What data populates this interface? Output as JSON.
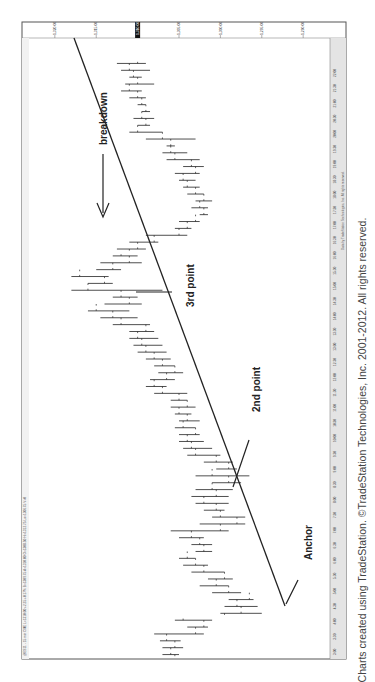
{
  "chart_data": {
    "type": "ohlc",
    "orientation": "rotated-90-ccw",
    "title": "",
    "header_text": "@ES11 - 15 min  CME  L=1310.00  +2.25  +0.17%  B=1309.75  A=1310.00  O=1308.50  Hi=1312.75  Lo=1306.75  V=0",
    "price_axis": {
      "side": "right",
      "ticks": [
        "1,320.00",
        "1,315.00",
        "1,310.00",
        "1,305.00",
        "1,300.00",
        "1,295.00",
        "1,290.00"
      ],
      "tick_values": [
        1320,
        1315,
        1310,
        1305,
        1300,
        1295,
        1290
      ],
      "last_price_label": "1,310.00",
      "ylim": [
        1287,
        1323
      ]
    },
    "time_axis": {
      "ticks": [
        "3:00",
        "3:30",
        "4:00",
        "4:30",
        "5:00",
        "5:30",
        "6:00",
        "6:30",
        "7:00",
        "7:30",
        "8:00",
        "8:30",
        "9:00",
        "9:30",
        "10:00",
        "10:30",
        "11:00",
        "11:30",
        "12:00",
        "12:30",
        "13:00",
        "13:30",
        "14:00",
        "14:30",
        "15:00",
        "15:30",
        "16:00",
        "16:30",
        "17:00",
        "17:30",
        "18:00",
        "18:30",
        "19:00",
        "19:30",
        "20:00",
        "20:30",
        "21:00",
        "21:30",
        "22:00"
      ]
    },
    "bars": [
      {
        "low": 1305.0,
        "high": 1307.0,
        "open": 1305.5,
        "close": 1306.0
      },
      {
        "low": 1304.5,
        "high": 1307.0,
        "open": 1306.0,
        "close": 1305.5
      },
      {
        "low": 1304.8,
        "high": 1307.3,
        "open": 1305.5,
        "close": 1306.5
      },
      {
        "low": 1302.0,
        "high": 1308.0,
        "open": 1306.5,
        "close": 1303.0
      },
      {
        "low": 1301.5,
        "high": 1304.0,
        "open": 1303.0,
        "close": 1302.0
      },
      {
        "low": 1301.0,
        "high": 1305.5,
        "open": 1302.0,
        "close": 1304.5
      },
      {
        "low": 1295.0,
        "high": 1300.0,
        "open": 1299.5,
        "close": 1297.5
      },
      {
        "low": 1295.5,
        "high": 1299.5,
        "open": 1297.5,
        "close": 1298.0
      },
      {
        "low": 1296.0,
        "high": 1299.0,
        "open": 1298.0,
        "close": 1296.5
      },
      {
        "low": 1297.5,
        "high": 1301.0,
        "open": 1296.5,
        "close": 1299.0
      },
      {
        "low": 1299.0,
        "high": 1302.5,
        "open": 1299.0,
        "close": 1300.5
      },
      {
        "low": 1298.5,
        "high": 1301.5,
        "open": 1300.5,
        "close": 1299.5
      },
      {
        "low": 1299.5,
        "high": 1303.5,
        "open": 1299.5,
        "close": 1302.0
      },
      {
        "low": 1301.5,
        "high": 1304.5,
        "open": 1302.0,
        "close": 1303.0
      },
      {
        "low": 1303.0,
        "high": 1305.0,
        "open": 1303.0,
        "close": 1304.0
      },
      {
        "low": 1301.0,
        "high": 1303.0,
        "open": 1304.0,
        "close": 1302.0
      },
      {
        "low": 1301.0,
        "high": 1303.5,
        "open": 1302.0,
        "close": 1302.5
      },
      {
        "low": 1302.0,
        "high": 1305.0,
        "open": 1302.5,
        "close": 1303.5
      },
      {
        "low": 1299.0,
        "high": 1306.0,
        "open": 1303.5,
        "close": 1300.0
      },
      {
        "low": 1297.0,
        "high": 1302.5,
        "open": 1300.0,
        "close": 1298.0
      },
      {
        "low": 1297.0,
        "high": 1301.0,
        "open": 1298.0,
        "close": 1300.0
      },
      {
        "low": 1299.5,
        "high": 1302.0,
        "open": 1300.0,
        "close": 1300.5
      },
      {
        "low": 1299.0,
        "high": 1303.0,
        "open": 1300.5,
        "close": 1302.0
      },
      {
        "low": 1299.0,
        "high": 1303.5,
        "open": 1302.0,
        "close": 1300.5
      },
      {
        "low": 1298.5,
        "high": 1303.0,
        "open": 1300.5,
        "close": 1301.0
      },
      {
        "low": 1297.5,
        "high": 1301.0,
        "open": 1301.0,
        "close": 1299.0
      },
      {
        "low": 1296.5,
        "high": 1303.0,
        "open": 1299.0,
        "close": 1301.0
      },
      {
        "low": 1298.0,
        "high": 1300.5,
        "open": 1301.0,
        "close": 1299.0
      },
      {
        "low": 1298.5,
        "high": 1302.0,
        "open": 1299.0,
        "close": 1300.5
      },
      {
        "low": 1300.0,
        "high": 1304.0,
        "open": 1300.5,
        "close": 1303.0
      },
      {
        "low": 1301.0,
        "high": 1304.5,
        "open": 1303.0,
        "close": 1303.5
      },
      {
        "low": 1302.0,
        "high": 1305.0,
        "open": 1303.5,
        "close": 1304.0
      },
      {
        "low": 1302.5,
        "high": 1305.0,
        "open": 1304.0,
        "close": 1303.0
      },
      {
        "low": 1303.0,
        "high": 1305.5,
        "open": 1303.0,
        "close": 1304.5
      },
      {
        "low": 1302.5,
        "high": 1305.0,
        "open": 1304.5,
        "close": 1304.0
      },
      {
        "low": 1303.5,
        "high": 1305.5,
        "open": 1304.0,
        "close": 1305.0
      },
      {
        "low": 1303.0,
        "high": 1306.0,
        "open": 1305.0,
        "close": 1304.0
      },
      {
        "low": 1304.0,
        "high": 1306.0,
        "open": 1304.0,
        "close": 1305.0
      },
      {
        "low": 1304.0,
        "high": 1308.0,
        "open": 1305.0,
        "close": 1307.0
      },
      {
        "low": 1306.5,
        "high": 1309.0,
        "open": 1307.0,
        "close": 1308.0
      },
      {
        "low": 1305.5,
        "high": 1308.5,
        "open": 1308.0,
        "close": 1306.5
      },
      {
        "low": 1304.5,
        "high": 1307.5,
        "open": 1306.5,
        "close": 1305.5
      },
      {
        "low": 1305.5,
        "high": 1308.0,
        "open": 1305.5,
        "close": 1307.0
      },
      {
        "low": 1306.0,
        "high": 1309.0,
        "open": 1307.0,
        "close": 1308.0
      },
      {
        "low": 1306.5,
        "high": 1310.0,
        "open": 1308.0,
        "close": 1309.0
      },
      {
        "low": 1307.0,
        "high": 1310.5,
        "open": 1309.0,
        "close": 1309.5
      },
      {
        "low": 1307.5,
        "high": 1311.0,
        "open": 1309.5,
        "close": 1310.0
      },
      {
        "low": 1308.0,
        "high": 1311.0,
        "open": 1310.0,
        "close": 1309.0
      },
      {
        "low": 1308.5,
        "high": 1313.0,
        "open": 1309.0,
        "close": 1312.0
      },
      {
        "low": 1310.0,
        "high": 1314.5,
        "open": 1312.0,
        "close": 1313.0
      },
      {
        "low": 1311.0,
        "high": 1316.0,
        "open": 1313.0,
        "close": 1315.0
      },
      {
        "low": 1309.5,
        "high": 1314.0,
        "open": 1315.0,
        "close": 1311.0
      },
      {
        "low": 1310.0,
        "high": 1313.0,
        "open": 1311.0,
        "close": 1312.0
      },
      {
        "low": 1307.0,
        "high": 1318.0,
        "open": 1312.0,
        "close": 1316.0
      },
      {
        "low": 1313.0,
        "high": 1316.0,
        "open": 1316.0,
        "close": 1314.0
      },
      {
        "low": 1313.5,
        "high": 1318.0,
        "open": 1314.0,
        "close": 1317.0
      },
      {
        "low": 1312.0,
        "high": 1315.0,
        "open": 1317.0,
        "close": 1313.0
      },
      {
        "low": 1309.5,
        "high": 1314.5,
        "open": 1313.0,
        "close": 1311.0
      },
      {
        "low": 1310.0,
        "high": 1313.0,
        "open": 1311.0,
        "close": 1312.0
      },
      {
        "low": 1309.0,
        "high": 1312.5,
        "open": 1311.0,
        "close": 1310.0
      },
      {
        "low": 1307.5,
        "high": 1311.0,
        "open": 1310.0,
        "close": 1308.0
      },
      {
        "low": 1304.0,
        "high": 1309.0,
        "open": 1308.0,
        "close": 1305.0
      },
      {
        "low": 1303.5,
        "high": 1305.5,
        "open": 1305.0,
        "close": 1304.0
      },
      {
        "low": 1302.5,
        "high": 1305.0,
        "open": 1304.0,
        "close": 1303.0
      },
      {
        "low": 1301.5,
        "high": 1302.5,
        "open": 1303.0,
        "close": 1302.0
      },
      {
        "low": 1301.5,
        "high": 1303.5,
        "open": 1302.0,
        "close": 1302.5
      },
      {
        "low": 1301.0,
        "high": 1303.0,
        "open": 1302.5,
        "close": 1302.0
      },
      {
        "low": 1302.0,
        "high": 1304.0,
        "open": 1302.0,
        "close": 1303.0
      },
      {
        "low": 1302.5,
        "high": 1304.5,
        "open": 1303.0,
        "close": 1304.0
      },
      {
        "low": 1303.0,
        "high": 1305.0,
        "open": 1304.0,
        "close": 1304.5
      },
      {
        "low": 1302.5,
        "high": 1305.5,
        "open": 1304.5,
        "close": 1303.0
      },
      {
        "low": 1302.0,
        "high": 1304.5,
        "open": 1303.0,
        "close": 1303.5
      },
      {
        "low": 1302.5,
        "high": 1306.5,
        "open": 1303.5,
        "close": 1305.5
      },
      {
        "low": 1304.0,
        "high": 1307.0,
        "open": 1305.5,
        "close": 1306.0
      },
      {
        "low": 1305.5,
        "high": 1306.5,
        "open": 1306.0,
        "close": 1306.0
      },
      {
        "low": 1303.0,
        "high": 1309.0,
        "open": 1306.0,
        "close": 1307.0
      },
      {
        "low": 1307.0,
        "high": 1311.0,
        "open": 1307.0,
        "close": 1310.0
      },
      {
        "low": 1308.5,
        "high": 1310.0,
        "open": 1310.0,
        "close": 1309.0
      },
      {
        "low": 1308.0,
        "high": 1310.5,
        "open": 1309.0,
        "close": 1309.5
      },
      {
        "low": 1308.5,
        "high": 1309.5,
        "open": 1309.5,
        "close": 1309.0
      },
      {
        "low": 1309.0,
        "high": 1310.0,
        "open": 1309.0,
        "close": 1309.5
      },
      {
        "low": 1309.0,
        "high": 1311.0,
        "open": 1309.5,
        "close": 1310.0
      },
      {
        "low": 1309.5,
        "high": 1312.0,
        "open": 1310.0,
        "close": 1311.0
      },
      {
        "low": 1308.0,
        "high": 1311.5,
        "open": 1311.0,
        "close": 1310.0
      },
      {
        "low": 1309.5,
        "high": 1311.0,
        "open": 1310.0,
        "close": 1310.5
      },
      {
        "low": 1308.5,
        "high": 1312.0,
        "open": 1310.5,
        "close": 1311.0
      },
      {
        "low": 1309.0,
        "high": 1312.5,
        "open": 1311.0,
        "close": 1310.0
      }
    ],
    "trendline": {
      "description": "rising trendline from Anchor through 2nd point and 3rd point, later broken",
      "start": {
        "bar_index": 10,
        "price": 1286.5
      },
      "end": {
        "bar_index": 92,
        "price": 1320.5
      }
    },
    "annotations": [
      {
        "text": "Anchor",
        "bar_index": 10
      },
      {
        "text": "2nd point",
        "bar_index": 19
      },
      {
        "text": "3rd point",
        "bar_index": 52
      },
      {
        "text": "breakdown",
        "bar_index": 60
      }
    ],
    "footer_text": "Data by TradeStation Technologies, Inc. All rights reserved."
  },
  "caption": "Charts created using TradeStation. ©TradeStation Technologies, Inc. 2001-2012. All rights reserved."
}
